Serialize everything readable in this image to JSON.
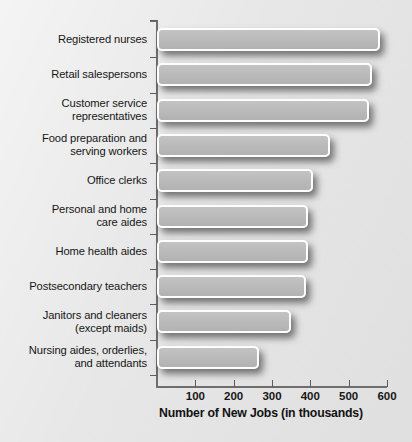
{
  "chart_data": {
    "type": "bar",
    "orientation": "horizontal",
    "title": "",
    "xlabel": "Number of New Jobs (in thousands)",
    "ylabel": "",
    "xlim": [
      0,
      640
    ],
    "xticks": [
      100,
      200,
      300,
      400,
      500,
      600
    ],
    "xtick_labels": [
      "100",
      "200",
      "300",
      "400",
      "500",
      "600"
    ],
    "grid": false,
    "legend": null,
    "categories": [
      "Registered nurses",
      "Retail salespersons",
      "Customer service\nrepresentatives",
      "Food preparation and\nserving workers",
      "Office clerks",
      "Personal and home\ncare aides",
      "Home health aides",
      "Postsecondary teachers",
      "Janitors and cleaners\n(except maids)",
      "Nursing aides, orderlies,\nand attendants"
    ],
    "values": [
      583,
      560,
      553,
      452,
      407,
      395,
      394,
      388,
      350,
      266
    ]
  },
  "colors": {
    "background": "#e8e8e8",
    "bar_fill": "#bcbcbc",
    "bar_border": "#fdfdfd",
    "axis": "#6e6e6e",
    "text": "#161616"
  }
}
